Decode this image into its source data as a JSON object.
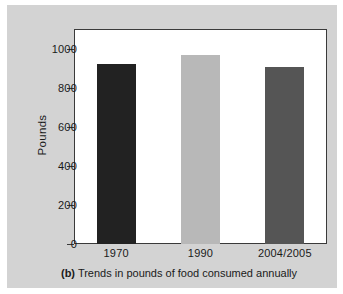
{
  "chart_data": {
    "type": "bar",
    "title": "",
    "caption_label": "(b)",
    "caption_text": "Trends in pounds of food consumed annually",
    "categories": [
      "1970",
      "1990",
      "2004/2005"
    ],
    "values": [
      920,
      965,
      905
    ],
    "series": [
      {
        "name": "Pounds of food consumed annually",
        "values": [
          920,
          965,
          905
        ]
      }
    ],
    "xlabel": "",
    "ylabel": "Pounds",
    "ylim": [
      0,
      1100
    ],
    "ytick_values": [
      0,
      200,
      400,
      600,
      800,
      1000
    ],
    "ytick_labels": [
      "0",
      "200",
      "400",
      "600",
      "800",
      "1000"
    ],
    "grid": false,
    "legend": "none",
    "bar_colors": [
      "#222222",
      "#b8b8b8",
      "#555555"
    ]
  },
  "figure": {
    "panel_color": "#d3d3d3",
    "plot_background": "#ffffff",
    "frame_color": "#3a3a3a",
    "text_color": "#1a1a1a"
  }
}
